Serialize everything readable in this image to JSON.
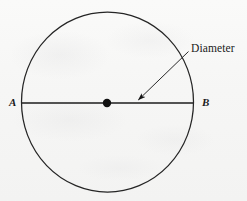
{
  "figure": {
    "kind": "geometry-diagram",
    "background_color": "#f7f7f6",
    "ink_color": "#1a1a1a",
    "width": 247,
    "height": 201,
    "circle": {
      "center_x": 107.5,
      "center_y": 102,
      "radius_x": 86,
      "radius_y": 90,
      "stroke_width": 1.2,
      "fill": "none"
    },
    "center_point": {
      "x": 107,
      "y": 103,
      "radius": 4.2,
      "fill": "#111111"
    },
    "diameter_segment": {
      "x1": 22,
      "y1": 103,
      "x2": 193,
      "y2": 103,
      "stroke_width": 1.3
    },
    "leader_line": {
      "x1": 188,
      "y1": 52,
      "x2": 137,
      "y2": 101,
      "stroke_width": 1.0,
      "arrowhead": "at-end-pointing-down-left"
    },
    "labels": {
      "point_a": "A",
      "point_b": "B",
      "diameter": "Diameter"
    }
  }
}
